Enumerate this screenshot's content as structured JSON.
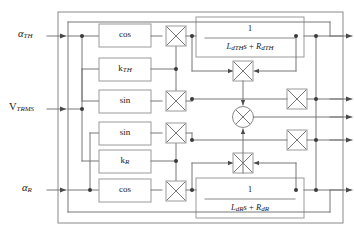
{
  "figure": {
    "type": "control-block-diagram",
    "title": "",
    "background": "#ffffff",
    "line_color": "#6b6b6b",
    "box_stroke": "#9a9a9a",
    "text_color": "#1a1a1a",
    "width": 354,
    "height": 235
  },
  "inputs": [
    {
      "id": "alpha-th",
      "base": "α",
      "sub": "TH",
      "label": "αTH",
      "x": 22,
      "y": 36
    },
    {
      "id": "v-trms",
      "base": "V",
      "sub": "TRMS",
      "label": "VTRMS",
      "x": 14,
      "y": 109
    },
    {
      "id": "alpha-r",
      "base": "α",
      "sub": "R",
      "label": "αR",
      "x": 26,
      "y": 190
    }
  ],
  "blocks": {
    "cos_top": {
      "label": "cos",
      "x": 99,
      "y": 24,
      "w": 52,
      "h": 22
    },
    "k_th": {
      "base": "k",
      "sub": "TH",
      "label": "kTH",
      "x": 99,
      "y": 58,
      "w": 52,
      "h": 22
    },
    "sin_top": {
      "label": "sin",
      "x": 99,
      "y": 90,
      "w": 52,
      "h": 22
    },
    "sin_bot": {
      "label": "sin",
      "x": 99,
      "y": 122,
      "w": 52,
      "h": 22
    },
    "k_r": {
      "base": "k",
      "sub": "R",
      "label": "kR",
      "x": 99,
      "y": 150,
      "w": 52,
      "h": 22
    },
    "cos_bot": {
      "label": "cos",
      "x": 99,
      "y": 180,
      "w": 52,
      "h": 22
    }
  },
  "transfer_functions": [
    {
      "id": "tf-th",
      "numerator": "1",
      "denominator_parts": [
        {
          "base": "L",
          "sub": "dTH"
        },
        {
          "base": "s",
          "sub": ""
        },
        {
          "op": " + "
        },
        {
          "base": "R",
          "sub": "dTH"
        }
      ],
      "denominator": "LdTHs + RdTH",
      "x": 196,
      "y": 17,
      "w": 108,
      "h": 40
    },
    {
      "id": "tf-r",
      "numerator": "1",
      "denominator_parts": [
        {
          "base": "L",
          "sub": "dR"
        },
        {
          "base": "s",
          "sub": ""
        },
        {
          "op": " + "
        },
        {
          "base": "R",
          "sub": "dR"
        }
      ],
      "denominator": "LdRs + RdR",
      "x": 196,
      "y": 178,
      "w": 108,
      "h": 40
    }
  ],
  "multipliers": [
    {
      "id": "mult-cos-th",
      "shape": "square-x",
      "x": 162,
      "y": 35
    },
    {
      "id": "mult-sin-th",
      "shape": "square-x",
      "x": 162,
      "y": 101
    },
    {
      "id": "mult-sin-r",
      "shape": "square-x",
      "x": 162,
      "y": 133
    },
    {
      "id": "mult-cos-r",
      "shape": "square-x",
      "x": 162,
      "y": 191
    },
    {
      "id": "mult-fb-th",
      "shape": "square-x",
      "x": 243,
      "y": 71
    },
    {
      "id": "mult-fb-r",
      "shape": "square-x",
      "x": 243,
      "y": 163
    },
    {
      "id": "mult-out-up",
      "shape": "square-x",
      "x": 297,
      "y": 99
    },
    {
      "id": "mult-out-dn",
      "shape": "square-x",
      "x": 297,
      "y": 140
    }
  ],
  "summing_junction": {
    "id": "sum-center",
    "shape": "circle-x",
    "x": 243,
    "y": 117,
    "r": 10
  },
  "outputs": [
    {
      "id": "out-1",
      "y": 36
    },
    {
      "id": "out-2",
      "y": 99
    },
    {
      "id": "out-3",
      "y": 117
    },
    {
      "id": "out-4",
      "y": 140
    },
    {
      "id": "out-5",
      "y": 190
    }
  ],
  "frame": {
    "x": 58,
    "y": 12,
    "w": 285,
    "h": 211
  }
}
